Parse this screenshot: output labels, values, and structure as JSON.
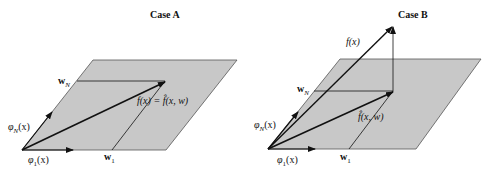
{
  "panels": [
    {
      "title": "Case A",
      "labels": {
        "wN": "w",
        "wN_sub": "N",
        "w1": "w",
        "w1_sub": "1",
        "phiN": "φ",
        "phiN_sub": "N",
        "phiN_arg": "(x)",
        "phi1": "φ",
        "phi1_sub": "1",
        "phi1_arg": "(x)",
        "fx": "f(x) = f̂(x, w)"
      }
    },
    {
      "title": "Case B",
      "labels": {
        "wN": "w",
        "wN_sub": "N",
        "w1": "w",
        "w1_sub": "1",
        "phiN": "φ",
        "phiN_sub": "N",
        "phiN_arg": "(x)",
        "phi1": "φ",
        "phi1_sub": "1",
        "phi1_arg": "(x)",
        "fx": "f(x)",
        "fhat": "f̂(x, w)"
      }
    }
  ],
  "colors": {
    "plane": "#c8c8c8",
    "stroke": "#111111"
  }
}
